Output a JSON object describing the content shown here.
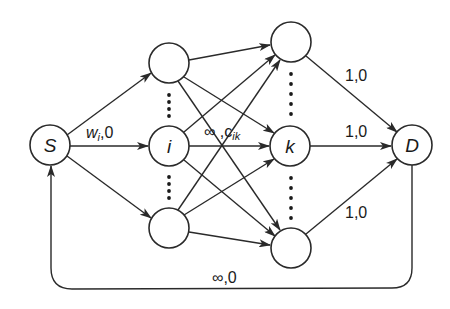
{
  "diagram": {
    "type": "flow-network",
    "nodes": [
      {
        "id": "S",
        "label": "S",
        "x": 50,
        "y": 145
      },
      {
        "id": "L_top",
        "label": "",
        "x": 169,
        "y": 63
      },
      {
        "id": "i",
        "label": "i",
        "x": 169,
        "y": 146
      },
      {
        "id": "L_bot",
        "label": "",
        "x": 169,
        "y": 228
      },
      {
        "id": "R_top",
        "label": "",
        "x": 291,
        "y": 42
      },
      {
        "id": "k",
        "label": "k",
        "x": 290,
        "y": 146
      },
      {
        "id": "R_bot",
        "label": "",
        "x": 291,
        "y": 248
      },
      {
        "id": "D",
        "label": "D",
        "x": 412,
        "y": 145
      }
    ],
    "edges": [
      {
        "from": "S",
        "to": "L_top"
      },
      {
        "from": "S",
        "to": "i",
        "label": "w_i,0"
      },
      {
        "from": "S",
        "to": "L_bot"
      },
      {
        "from": "L_top",
        "to": "R_top"
      },
      {
        "from": "L_top",
        "to": "k"
      },
      {
        "from": "L_top",
        "to": "R_bot"
      },
      {
        "from": "i",
        "to": "R_top"
      },
      {
        "from": "i",
        "to": "k",
        "label": "∞,c_ik"
      },
      {
        "from": "i",
        "to": "R_bot"
      },
      {
        "from": "L_bot",
        "to": "R_top"
      },
      {
        "from": "L_bot",
        "to": "k"
      },
      {
        "from": "L_bot",
        "to": "R_bot"
      },
      {
        "from": "R_top",
        "to": "D",
        "label": "1,0"
      },
      {
        "from": "k",
        "to": "D",
        "label": "1,0"
      },
      {
        "from": "R_bot",
        "to": "D",
        "label": "1,0"
      },
      {
        "from": "D",
        "to": "S",
        "label": "∞,0",
        "routing": "return-loop-below"
      }
    ],
    "labels": {
      "S": "S",
      "i": "i",
      "k": "k",
      "D": "D",
      "w_main": "w",
      "w_sub": "i",
      "w_rest": ",0",
      "inf_cik_main": "∞ ,c",
      "inf_cik_sub": "ik",
      "r_top": "1,0",
      "r_mid": "1,0",
      "r_bot": "1,0",
      "return": "∞,0"
    }
  }
}
